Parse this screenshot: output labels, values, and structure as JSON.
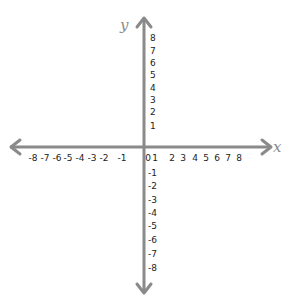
{
  "diagram": {
    "type": "coordinate-plane",
    "x_axis": {
      "name": "x",
      "ticks": [
        "-8",
        "-7",
        "-6",
        "-5",
        "-4",
        "-3",
        "-2",
        "-1",
        "0",
        "1",
        "2",
        "3",
        "4",
        "5",
        "6",
        "7",
        "8"
      ],
      "range": [
        -8,
        8
      ]
    },
    "y_axis": {
      "name": "y",
      "ticks_positive": [
        "8",
        "7",
        "6",
        "5",
        "4",
        "3",
        "2",
        "1"
      ],
      "ticks_negative": [
        "-1",
        "-2",
        "-3",
        "-4",
        "-5",
        "-6",
        "-7",
        "-8"
      ],
      "range": [
        -8,
        8
      ]
    },
    "colors": {
      "axis": "#8a8a8a",
      "labels": "#222222"
    }
  }
}
